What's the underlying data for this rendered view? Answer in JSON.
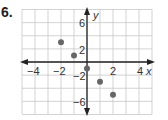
{
  "problem": {
    "number": "6."
  },
  "chart_data": {
    "type": "scatter",
    "title": "",
    "xlabel": "x",
    "ylabel": "y",
    "xlim": [
      -5,
      5
    ],
    "ylim": [
      -8,
      8
    ],
    "x_step": 1,
    "y_step": 2,
    "grid": true,
    "x_tick_labels": [
      "-4",
      "-2",
      "2",
      "4"
    ],
    "y_tick_labels": [
      "6",
      "2",
      "-2",
      "-6"
    ],
    "points": [
      {
        "x": -2,
        "y": 3
      },
      {
        "x": -1,
        "y": 1
      },
      {
        "x": 0,
        "y": -1
      },
      {
        "x": 1,
        "y": -3
      },
      {
        "x": 2,
        "y": -5
      }
    ],
    "point_color": "#666666",
    "grid_color": "#c8c8c8",
    "axis_color": "#222222"
  },
  "labels": {
    "x_axis": "x",
    "y_axis": "y",
    "xt_m4": "−4",
    "xt_m2": "−2",
    "xt_2": "2",
    "xt_4": "4",
    "yt_6": "6",
    "yt_2": "2",
    "yt_m2": "−2",
    "yt_m6": "−6"
  }
}
